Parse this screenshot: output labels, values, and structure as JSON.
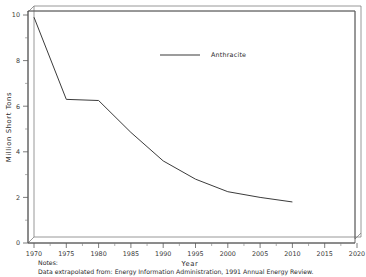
{
  "chart_data": {
    "type": "line",
    "title": "",
    "xlabel": "Year",
    "ylabel": "Million Short Tons",
    "xlim": [
      1970,
      2020
    ],
    "ylim": [
      0,
      10
    ],
    "grid": false,
    "legend_position": "top-center",
    "x_ticks": [
      "1970",
      "1975",
      "1980",
      "1985",
      "1990",
      "1995",
      "2000",
      "2005",
      "2010",
      "2015",
      "2020"
    ],
    "y_ticks": [
      "0",
      "2",
      "4",
      "6",
      "8",
      "10"
    ],
    "series": [
      {
        "name": "Anthracite",
        "color": "#3b3b3b",
        "x": [
          1970,
          1975,
          1980,
          1985,
          1990,
          1995,
          2000,
          2005,
          2010
        ],
        "values": [
          9.9,
          6.3,
          6.25,
          4.85,
          3.6,
          2.8,
          2.25,
          2.0,
          1.8
        ]
      }
    ]
  },
  "legend": {
    "entries": [
      {
        "label": "Anthracite"
      }
    ]
  },
  "notes": {
    "heading": "Notes:",
    "body": "Data extrapolated from: Energy Information Administration, 1991 Annual Energy Review."
  }
}
